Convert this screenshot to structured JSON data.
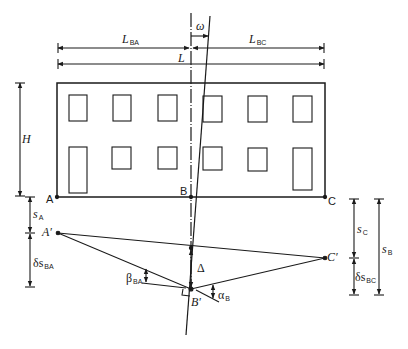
{
  "figure": {
    "points": {
      "A": "A",
      "B": "B",
      "C": "C",
      "A_prime": "A′",
      "B_prime": "B′",
      "C_prime": "C′"
    },
    "dimensions": {
      "L_BA": {
        "main": "L",
        "sub": "BA"
      },
      "L_BC": {
        "main": "L",
        "sub": "BC"
      },
      "L": {
        "main": "L"
      },
      "H": {
        "main": "H"
      },
      "s_A": {
        "main": "s",
        "sub": "A"
      },
      "ds_BA": {
        "main": "δs",
        "sub": "BA"
      },
      "s_C": {
        "main": "s",
        "sub": "C"
      },
      "ds_BC": {
        "main": "δs",
        "sub": "BC"
      },
      "s_B": {
        "main": "s",
        "sub": "B"
      }
    },
    "angles": {
      "omega": {
        "main": "ω"
      },
      "beta_BA": {
        "main": "β",
        "sub": "BA"
      },
      "alpha_B": {
        "main": "α",
        "sub": "B"
      }
    },
    "deflection": {
      "main": "Δ"
    },
    "building": {
      "rows": 2,
      "windows_per_row": 6
    }
  }
}
